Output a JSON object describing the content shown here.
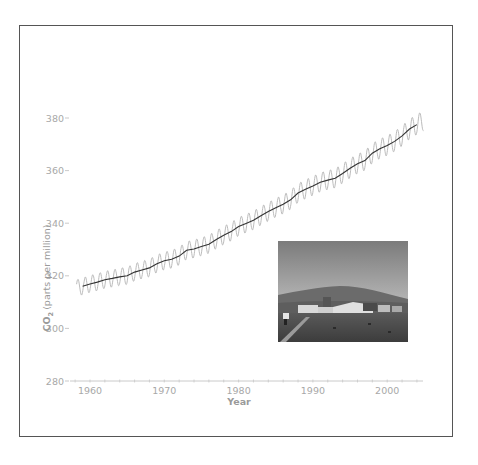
{
  "chart_data": {
    "type": "line",
    "title": "",
    "xlabel": "Year",
    "ylabel": "CO2 (parts per million)",
    "ylabel_parts": {
      "main": "CO",
      "subscript": "2",
      "rest": " (parts per million)"
    },
    "xlim": [
      1958,
      2005
    ],
    "ylim": [
      280,
      380
    ],
    "x_ticks": [
      1960,
      1970,
      1980,
      1990,
      2000
    ],
    "y_ticks": [
      280,
      300,
      320,
      340,
      360,
      380
    ],
    "grid": false,
    "legend": null,
    "series": [
      {
        "name": "Annual mean (smoothed trend)",
        "color": "#333333",
        "x": [
          1959,
          1960,
          1961,
          1962,
          1963,
          1964,
          1965,
          1966,
          1967,
          1968,
          1969,
          1970,
          1971,
          1972,
          1973,
          1974,
          1975,
          1976,
          1977,
          1978,
          1979,
          1980,
          1981,
          1982,
          1983,
          1984,
          1985,
          1986,
          1987,
          1988,
          1989,
          1990,
          1991,
          1992,
          1993,
          1994,
          1995,
          1996,
          1997,
          1998,
          1999,
          2000,
          2001,
          2002,
          2003,
          2004
        ],
        "values": [
          316.0,
          316.9,
          317.6,
          318.5,
          319.0,
          319.6,
          320.0,
          321.4,
          322.2,
          323.0,
          324.6,
          325.7,
          326.3,
          327.5,
          329.7,
          330.2,
          331.1,
          332.0,
          333.8,
          335.4,
          336.8,
          338.7,
          339.9,
          341.1,
          342.8,
          344.4,
          345.9,
          347.2,
          348.9,
          351.5,
          352.9,
          354.2,
          355.6,
          356.4,
          357.1,
          358.9,
          360.9,
          362.6,
          363.8,
          366.6,
          368.3,
          369.5,
          371.1,
          373.2,
          375.8,
          377.5
        ]
      },
      {
        "name": "Monthly values (seasonal cycle)",
        "color": "#b0b0b0",
        "seasonal_amplitude_ppm": 3.2,
        "x_start": 1958.2,
        "x_end": 2004.9,
        "note": "monthly oscillation around the annual mean, peak ~May, trough ~Oct"
      }
    ]
  },
  "axes": {
    "y_tick_labels": [
      "380",
      "360",
      "340",
      "320",
      "300",
      "280"
    ],
    "x_tick_labels": [
      "1960",
      "1970",
      "1980",
      "1990",
      "2000"
    ],
    "x_title": "Year",
    "y_title_main": "CO",
    "y_title_sub": "2",
    "y_title_rest": "(parts per million)"
  },
  "inset_photo": {
    "subject": "Mauna Loa Observatory with mountain in background",
    "colors": {
      "sky_top": "#7d7d7d",
      "sky_bottom": "#bdbdbd",
      "mountain": "#6a6a6a",
      "ground": "#4a4a4a",
      "buildings": "#d8d8d8"
    }
  },
  "colors": {
    "frame": "#555555",
    "trend_line": "#333333",
    "seasonal_line": "#b0b0b0",
    "axis": "#b8b8b8",
    "tick_text": "#a8a8a8"
  }
}
